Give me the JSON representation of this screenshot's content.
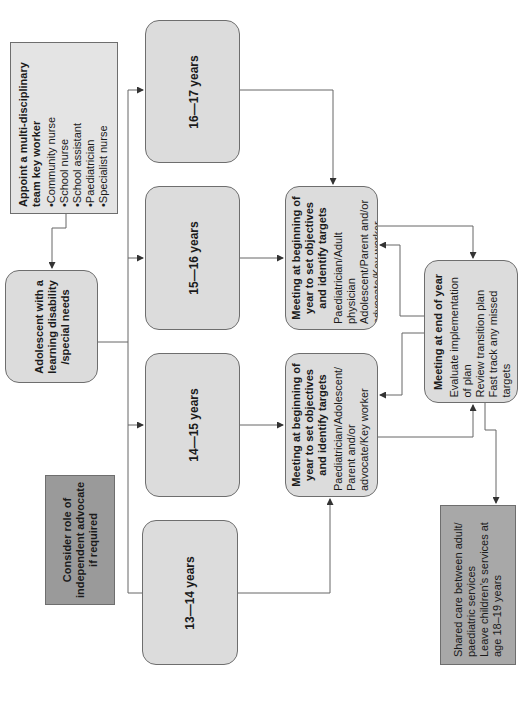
{
  "diagram": {
    "orientation": "rotated-90-ccw",
    "colors": {
      "box_fill": "#dcdcdc",
      "advocate_fill": "#9a9a9a",
      "border": "#6e6e6e",
      "line": "#555555"
    },
    "key_worker": {
      "title": "Appoint a multi-disciplinary team key worker",
      "items": [
        "Community nurse",
        "School nurse",
        "School assistant",
        "Paediatrician",
        "Specialist nurse"
      ]
    },
    "adolescent": {
      "label": "Adolescent with a learning disability /special needs"
    },
    "advocate": {
      "label": "Consider role of independent advocate if required"
    },
    "ages": [
      {
        "label": "16—17 years"
      },
      {
        "label": "15—16 years"
      },
      {
        "label": "14—15 years"
      },
      {
        "label": "13—14 years"
      }
    ],
    "meeting_upper": {
      "title": "Meeting at beginning of year to set objectives and identify targets",
      "body": "Paediatrician/Adult physician Adolescent/Parent and/or advocate/Key worker"
    },
    "meeting_lower": {
      "title": "Meeting at beginning of year to set objectives and identify targets",
      "body": "Paediatrician/Adolescent/ Parent and/or advocate/Key worker"
    },
    "meeting_end": {
      "title": "Meeting at end of year",
      "lines": [
        "Evaluate implementation of plan",
        "Review transition plan",
        "Fast track any missed targets"
      ]
    },
    "shared_care": {
      "lines": [
        "Shared care between adult/ paediatric services",
        "Leave children’s services at age 18–19 years"
      ]
    }
  }
}
